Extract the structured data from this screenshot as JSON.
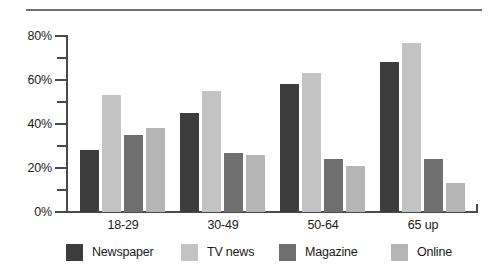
{
  "chart_data": {
    "type": "bar",
    "title": "",
    "xlabel": "",
    "ylabel": "",
    "categories": [
      "18-29",
      "30-49",
      "50-64",
      "65 up"
    ],
    "series": [
      {
        "name": "Newspaper",
        "color": "#3d3d3d",
        "values": [
          28,
          45,
          58,
          68
        ]
      },
      {
        "name": "TV news",
        "color": "#c3c3c3",
        "values": [
          53,
          55,
          63,
          77
        ]
      },
      {
        "name": "Magazine",
        "color": "#6f6f6f",
        "values": [
          35,
          27,
          24,
          24
        ]
      },
      {
        "name": "Online",
        "color": "#b5b5b5",
        "values": [
          38,
          26,
          21,
          13
        ]
      }
    ],
    "ylim": [
      0,
      80
    ],
    "y_major_ticks": [
      0,
      20,
      40,
      60,
      80
    ],
    "y_minor_ticks": [
      10,
      30,
      50,
      70
    ],
    "y_tick_labels": [
      "0%",
      "20%",
      "40%",
      "60%",
      "80%"
    ],
    "grid": false,
    "legend_position": "bottom"
  },
  "axis": {
    "y_labels": [
      "80%",
      "60%",
      "40%",
      "20%",
      "0%"
    ]
  }
}
